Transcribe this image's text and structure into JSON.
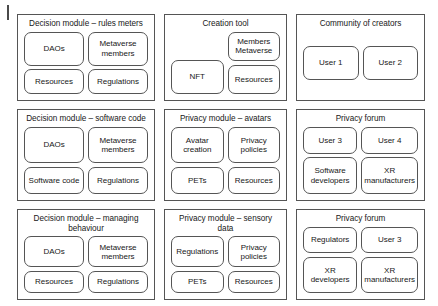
{
  "figure": {
    "panels": [
      {
        "id": "decision-module-rules-meters",
        "title": "Decision module – rules meters",
        "layout": "two-by-two",
        "cells": [
          "DAOs",
          "Metaverse members",
          "Resources",
          "Regulations"
        ]
      },
      {
        "id": "creation-tool",
        "title": "Creation tool",
        "layout": "creation",
        "cells": [
          "Members Metaverse",
          "NFT",
          "Resources"
        ]
      },
      {
        "id": "community-of-creators",
        "title": "Community of creators",
        "layout": "one-row",
        "cells": [
          "User 1",
          "User 2"
        ]
      },
      {
        "id": "decision-module-software-code",
        "title": "Decision module – software code",
        "layout": "two-by-two",
        "cells": [
          "DAOs",
          "Metaverse members",
          "Software code",
          "Regulations"
        ]
      },
      {
        "id": "privacy-module-avatars",
        "title": "Privacy module – avatars",
        "layout": "two-by-two",
        "cells": [
          "Avatar creation",
          "Privacy policies",
          "PETs",
          "Resources"
        ]
      },
      {
        "id": "privacy-forum-upper",
        "title": "Privacy forum",
        "layout": "two-by-two",
        "cells": [
          "User 3",
          "User 4",
          "Software developers",
          "XR manufacturers"
        ]
      },
      {
        "id": "decision-module-managing-behaviour",
        "title": "Decision module – managing behaviour",
        "layout": "two-by-two",
        "cells": [
          "DAOs",
          "Metaverse members",
          "Resources",
          "Regulations"
        ]
      },
      {
        "id": "privacy-module-sensory-data",
        "title": "Privacy module – sensory data",
        "layout": "two-by-two",
        "cells": [
          "Regulations",
          "Privacy policies",
          "PETs",
          "Resources"
        ]
      },
      {
        "id": "privacy-forum-lower",
        "title": "Privacy forum",
        "layout": "two-by-two",
        "cells": [
          "Regulators",
          "User 3",
          "XR developers",
          "XR manufacturers"
        ]
      }
    ]
  },
  "colors": {
    "stroke": "#555555",
    "text": "#181818",
    "background": "#ffffff"
  }
}
